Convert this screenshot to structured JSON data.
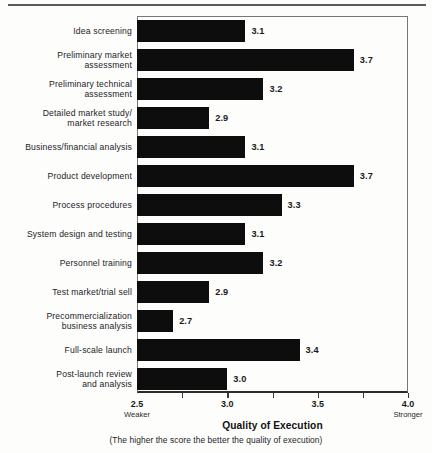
{
  "chart_data": {
    "type": "bar",
    "orientation": "horizontal",
    "title": "",
    "xlabel": "Quality of Execution",
    "ylabel": "",
    "note": "(The higher the score the better the quality of execution)",
    "xlim": [
      2.5,
      4.0
    ],
    "grid": false,
    "legend": null,
    "axis_endpoint_labels": {
      "low": "Weaker",
      "high": "Stronger"
    },
    "xticks": [
      "2.5",
      "3.0",
      "3.5",
      "4.0"
    ],
    "xtick_values": [
      2.5,
      3.0,
      3.5,
      4.0
    ],
    "minor_tick_values": [
      2.75,
      3.25,
      3.75
    ],
    "categories": [
      "Idea screening",
      "Preliminary market\nassessment",
      "Preliminary technical\nassessment",
      "Detailed market study/\nmarket research",
      "Business/financial analysis",
      "Product development",
      "Process procedures",
      "System design and testing",
      "Personnel training",
      "Test market/trial sell",
      "Precommercialization\nbusiness analysis",
      "Full-scale launch",
      "Post-launch review\nand analysis"
    ],
    "values": [
      3.1,
      3.7,
      3.2,
      2.9,
      3.1,
      3.7,
      3.3,
      3.1,
      3.2,
      2.9,
      2.7,
      3.4,
      3.0
    ],
    "value_labels": [
      "3.1",
      "3.7",
      "3.2",
      "2.9",
      "3.1",
      "3.7",
      "3.3",
      "3.1",
      "3.2",
      "2.9",
      "2.7",
      "3.4",
      "3.0"
    ],
    "bar_color": "#0d0d0d",
    "background_color": "#fdfdfc",
    "axis_color": "#2b2b2b"
  }
}
